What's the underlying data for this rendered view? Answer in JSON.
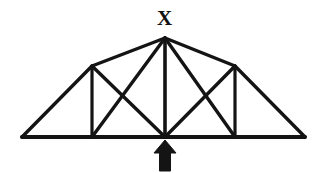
{
  "figure": {
    "kind": "engineering-diagram",
    "width": 327,
    "height": 173,
    "background_color": "#ffffff",
    "line_color": "#141414",
    "labels": [
      {
        "id": "apex",
        "text": "X",
        "x": 157,
        "y": 8
      }
    ],
    "nodes": {
      "bottom_left": {
        "x": 22,
        "y": 137
      },
      "bottom_panel_left": {
        "x": 92,
        "y": 137
      },
      "bottom_center": {
        "x": 165,
        "y": 137
      },
      "bottom_panel_right": {
        "x": 235,
        "y": 137
      },
      "bottom_right": {
        "x": 305,
        "y": 137
      },
      "top_left_joint": {
        "x": 92,
        "y": 66
      },
      "apex": {
        "x": 165,
        "y": 38
      },
      "top_right_joint": {
        "x": 235,
        "y": 66
      }
    },
    "members": [
      {
        "name": "bottom-chord",
        "x1": 22,
        "y1": 137,
        "x2": 305,
        "y2": 137,
        "width": 4.0
      },
      {
        "name": "top-chord-left-outer",
        "x1": 22,
        "y1": 137,
        "x2": 92,
        "y2": 66,
        "width": 3.4
      },
      {
        "name": "top-chord-left-inner",
        "x1": 92,
        "y1": 66,
        "x2": 165,
        "y2": 38,
        "width": 3.4
      },
      {
        "name": "top-chord-right-inner",
        "x1": 165,
        "y1": 38,
        "x2": 235,
        "y2": 66,
        "width": 3.4
      },
      {
        "name": "top-chord-right-outer",
        "x1": 235,
        "y1": 66,
        "x2": 305,
        "y2": 137,
        "width": 3.4
      },
      {
        "name": "vertical-left",
        "x1": 92,
        "y1": 66,
        "x2": 92,
        "y2": 137,
        "width": 3.2
      },
      {
        "name": "vertical-center",
        "x1": 165,
        "y1": 38,
        "x2": 165,
        "y2": 137,
        "width": 3.6
      },
      {
        "name": "vertical-right",
        "x1": 235,
        "y1": 66,
        "x2": 235,
        "y2": 137,
        "width": 3.2
      },
      {
        "name": "diagonal-left-panel-down",
        "x1": 92,
        "y1": 66,
        "x2": 165,
        "y2": 137,
        "width": 3.4
      },
      {
        "name": "diagonal-left-panel-up",
        "x1": 92,
        "y1": 137,
        "x2": 165,
        "y2": 38,
        "width": 3.4
      },
      {
        "name": "diagonal-right-panel-down",
        "x1": 165,
        "y1": 38,
        "x2": 235,
        "y2": 137,
        "width": 3.4
      },
      {
        "name": "diagonal-right-panel-up",
        "x1": 165,
        "y1": 137,
        "x2": 235,
        "y2": 66,
        "width": 3.4
      }
    ],
    "load_arrow": {
      "name": "upward-point-load",
      "direction": "up",
      "tip_x": 165,
      "tip_y": 140,
      "tail_y": 171,
      "head_width": 22,
      "head_height": 13,
      "shaft_width": 9,
      "color": "#141414"
    }
  }
}
